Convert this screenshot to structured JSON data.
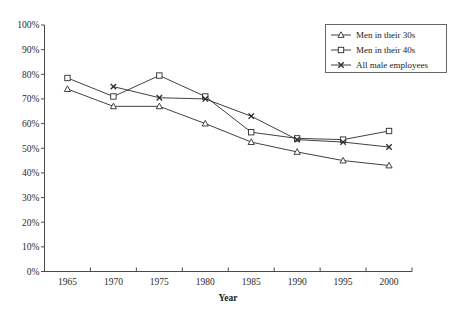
{
  "chart_data": {
    "type": "line",
    "title": "",
    "xlabel": "Year",
    "ylabel": "",
    "categories": [
      "1965",
      "1970",
      "1975",
      "1980",
      "1985",
      "1990",
      "1995",
      "2000"
    ],
    "x": [
      1965,
      1970,
      1975,
      1980,
      1985,
      1990,
      1995,
      2000
    ],
    "series": [
      {
        "name": "Men in their 30s",
        "marker": "open-triangle",
        "values": [
          74,
          67,
          67,
          60,
          52.5,
          48.5,
          45,
          43
        ]
      },
      {
        "name": "Men in their 40s",
        "marker": "open-square",
        "values": [
          78.5,
          71,
          79.5,
          71,
          56.5,
          54,
          53.5,
          57
        ]
      },
      {
        "name": "All male employees",
        "marker": "x-cross",
        "values": [
          null,
          75,
          70.5,
          70,
          63,
          53.5,
          52.5,
          50.5
        ]
      }
    ],
    "ylim": [
      0,
      100
    ],
    "ytick_values": [
      0,
      10,
      20,
      30,
      40,
      50,
      60,
      70,
      80,
      90,
      100
    ],
    "ytick_labels": [
      "0%",
      "10%",
      "20%",
      "30%",
      "40%",
      "50%",
      "60%",
      "70%",
      "80%",
      "90%",
      "100%"
    ],
    "yunit": "%",
    "grid": false,
    "legend_position": "top-right",
    "legend_entries": [
      "Men in their 30s",
      "Men in their 40s",
      "All male employees"
    ],
    "line_color": "#2b2b2b",
    "axis_color": "#4a4a4a",
    "background": "#ffffff"
  },
  "axes": {
    "x_axis_title": "Year",
    "x_tick_labels": [
      "1965",
      "1970",
      "1975",
      "1980",
      "1985",
      "1990",
      "1995",
      "2000"
    ],
    "y_tick_labels": [
      "100%",
      "90%",
      "80%",
      "70%",
      "60%",
      "50%",
      "40%",
      "30%",
      "20%",
      "10%",
      "0%"
    ]
  },
  "legend": {
    "items": [
      {
        "label": "Men in their 30s",
        "marker": "open-triangle-marker"
      },
      {
        "label": "Men in their 40s",
        "marker": "open-square-marker"
      },
      {
        "label": "All male employees",
        "marker": "x-cross-marker"
      }
    ]
  }
}
